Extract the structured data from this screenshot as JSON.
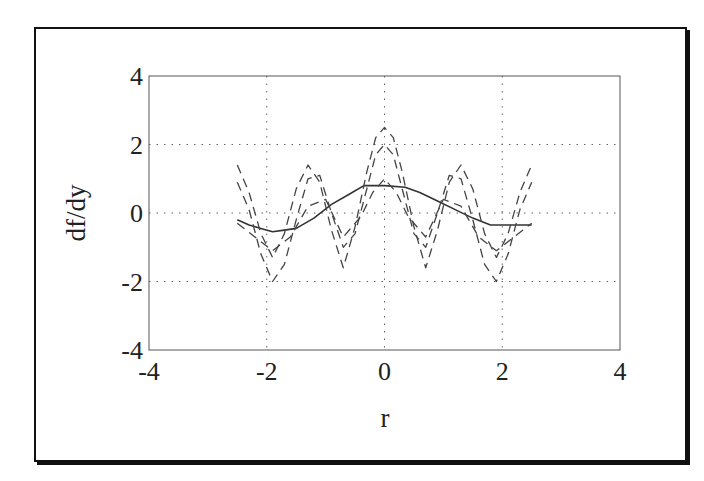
{
  "chart_data": {
    "type": "line",
    "title": "",
    "xlabel": "r",
    "ylabel": "df/dy",
    "xlim": [
      -4,
      4
    ],
    "ylim": [
      -4,
      4
    ],
    "xticks": [
      -4,
      -2,
      0,
      2,
      4
    ],
    "yticks": [
      -4,
      -2,
      0,
      2,
      4
    ],
    "grid": true,
    "legend": null,
    "series": [
      {
        "name": "solid",
        "style": "solid",
        "x": [
          -2.5,
          -2.3,
          -2.1,
          -1.9,
          -1.7,
          -1.5,
          -1.2,
          -0.9,
          -0.6,
          -0.35,
          0.0,
          0.35,
          0.6,
          0.9,
          1.2,
          1.5,
          1.8,
          2.1,
          2.5
        ],
        "y": [
          -0.2,
          -0.35,
          -0.45,
          -0.55,
          -0.5,
          -0.45,
          -0.15,
          0.25,
          0.55,
          0.8,
          0.8,
          0.75,
          0.6,
          0.35,
          0.1,
          -0.15,
          -0.35,
          -0.35,
          -0.35
        ]
      },
      {
        "name": "dashed-1",
        "style": "dashed",
        "x": [
          -2.5,
          -2.3,
          -2.1,
          -1.9,
          -1.7,
          -1.5,
          -1.3,
          -1.1,
          -0.9,
          -0.7,
          -0.5,
          -0.3,
          -0.15,
          0.0,
          0.15,
          0.3,
          0.5,
          0.7,
          0.9,
          1.1,
          1.3,
          1.5,
          1.7,
          1.9,
          2.1,
          2.3,
          2.5
        ],
        "y": [
          1.4,
          0.6,
          -0.6,
          -1.3,
          -0.6,
          0.7,
          1.4,
          0.9,
          -0.5,
          -1.6,
          -0.4,
          1.2,
          2.2,
          2.5,
          2.2,
          1.2,
          -0.4,
          -1.6,
          -0.5,
          0.9,
          1.4,
          0.7,
          -0.6,
          -1.3,
          -0.6,
          0.6,
          1.4
        ]
      },
      {
        "name": "dashed-2",
        "style": "dashed",
        "x": [
          -2.5,
          -2.3,
          -2.1,
          -1.9,
          -1.7,
          -1.5,
          -1.3,
          -1.1,
          -0.9,
          -0.7,
          -0.5,
          -0.3,
          -0.15,
          0.0,
          0.15,
          0.3,
          0.5,
          0.7,
          0.9,
          1.1,
          1.3,
          1.5,
          1.7,
          1.9,
          2.1,
          2.3,
          2.5
        ],
        "y": [
          0.9,
          0.1,
          -1.2,
          -2.0,
          -1.5,
          -0.2,
          1.0,
          1.1,
          0.0,
          -1.0,
          -0.6,
          0.7,
          1.7,
          2.0,
          1.7,
          0.7,
          -0.6,
          -1.0,
          0.0,
          1.1,
          1.0,
          -0.2,
          -1.5,
          -2.0,
          -1.2,
          0.1,
          0.9
        ]
      },
      {
        "name": "dashed-3",
        "style": "dashed",
        "x": [
          -2.5,
          -2.2,
          -1.9,
          -1.6,
          -1.3,
          -1.0,
          -0.7,
          -0.4,
          -0.2,
          0.0,
          0.2,
          0.4,
          0.7,
          1.0,
          1.3,
          1.6,
          1.9,
          2.2,
          2.5
        ],
        "y": [
          -0.3,
          -0.7,
          -1.1,
          -0.7,
          0.2,
          0.4,
          -0.7,
          -0.1,
          0.6,
          1.0,
          0.6,
          -0.1,
          -0.7,
          0.4,
          0.2,
          -0.7,
          -1.1,
          -0.7,
          -0.3
        ]
      }
    ]
  }
}
